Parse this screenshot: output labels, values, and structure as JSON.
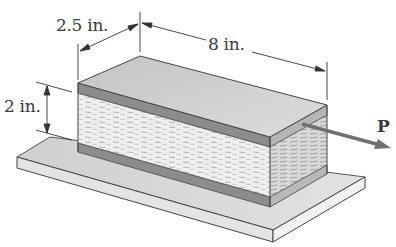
{
  "figure": {
    "colors": {
      "top_face": "#cfcfcf",
      "plate": "#8f8f8f",
      "plate_side": "#a8a8a8",
      "core": "#eeeeee",
      "core_side": "#d9d9d9",
      "base_top": "#d6d6d6",
      "base_front": "#e6e6e6",
      "base_side": "#f0f0f0",
      "edge": "#444444",
      "arrow": "#6e6e6e"
    }
  },
  "dimensions": {
    "width": {
      "label": "2.5 in."
    },
    "length": {
      "label": "8 in."
    },
    "height": {
      "label": "2 in."
    }
  },
  "load": {
    "label": "P"
  }
}
